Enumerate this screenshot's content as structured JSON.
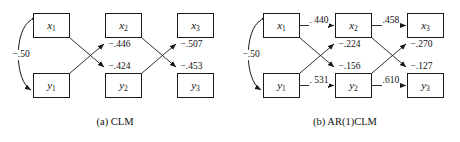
{
  "figure": {
    "width": 460,
    "height": 142,
    "background": "#ffffff",
    "stroke_color": "#1a1a1a"
  },
  "panels": [
    {
      "id": "clm",
      "caption": "(a) CLM",
      "nodes": [
        {
          "name": "x1",
          "var": "x",
          "sub": "1",
          "x": 33,
          "y": 13,
          "w": 37,
          "h": 25
        },
        {
          "name": "x2",
          "var": "x",
          "sub": "2",
          "x": 105,
          "y": 13,
          "w": 37,
          "h": 25
        },
        {
          "name": "x3",
          "var": "x",
          "sub": "3",
          "x": 177,
          "y": 13,
          "w": 37,
          "h": 25
        },
        {
          "name": "y1",
          "var": "y",
          "sub": "1",
          "x": 33,
          "y": 73,
          "w": 37,
          "h": 25
        },
        {
          "name": "y2",
          "var": "y",
          "sub": "2",
          "x": 105,
          "y": 73,
          "w": 37,
          "h": 25
        },
        {
          "name": "y3",
          "var": "y",
          "sub": "3",
          "x": 177,
          "y": 73,
          "w": 37,
          "h": 25
        }
      ],
      "covariance": {
        "label": "−.50",
        "from": "x1",
        "to": "y1",
        "label_x": 12,
        "label_y": 50
      },
      "paths": [
        {
          "name": "x1-to-y2",
          "label": "−.424",
          "from": "x1",
          "to": "y2",
          "label_x": 108,
          "label_y": 62
        },
        {
          "name": "y1-to-x2",
          "label": "−.446",
          "from": "y1",
          "to": "x2",
          "label_x": 108,
          "label_y": 40
        },
        {
          "name": "x2-to-y3",
          "label": "−.453",
          "from": "x2",
          "to": "y3",
          "label_x": 180,
          "label_y": 62
        },
        {
          "name": "y2-to-x3",
          "label": "−.507",
          "from": "y2",
          "to": "x3",
          "label_x": 180,
          "label_y": 40
        }
      ]
    },
    {
      "id": "ar1clm",
      "caption": "(b) AR(1)CLM",
      "nodes": [
        {
          "name": "x1",
          "var": "x",
          "sub": "1",
          "x": 33,
          "y": 13,
          "w": 37,
          "h": 25
        },
        {
          "name": "x2",
          "var": "x",
          "sub": "2",
          "x": 105,
          "y": 13,
          "w": 37,
          "h": 25
        },
        {
          "name": "x3",
          "var": "x",
          "sub": "3",
          "x": 177,
          "y": 13,
          "w": 37,
          "h": 25
        },
        {
          "name": "y1",
          "var": "y",
          "sub": "1",
          "x": 33,
          "y": 73,
          "w": 37,
          "h": 25
        },
        {
          "name": "y2",
          "var": "y",
          "sub": "2",
          "x": 105,
          "y": 73,
          "w": 37,
          "h": 25
        },
        {
          "name": "y3",
          "var": "y",
          "sub": "3",
          "x": 177,
          "y": 73,
          "w": 37,
          "h": 25
        }
      ],
      "covariance": {
        "label": "−.50",
        "from": "x1",
        "to": "y1",
        "label_x": 12,
        "label_y": 50
      },
      "paths": [
        {
          "name": "x1-to-x2",
          "label": ". 440",
          "from": "x1",
          "to": "x2",
          "label_x": 79,
          "label_y": 16
        },
        {
          "name": "x2-to-x3",
          "label": ".458",
          "from": "x2",
          "to": "x3",
          "label_x": 152,
          "label_y": 16
        },
        {
          "name": "y1-to-y2",
          "label": ". 531",
          "from": "y1",
          "to": "y2",
          "label_x": 79,
          "label_y": 76
        },
        {
          "name": "y2-to-y3",
          "label": ".610",
          "from": "y2",
          "to": "y3",
          "label_x": 152,
          "label_y": 76
        },
        {
          "name": "y1-to-x2",
          "label": "−.224",
          "from": "y1",
          "to": "x2",
          "label_x": 108,
          "label_y": 40
        },
        {
          "name": "x1-to-y2",
          "label": "−.156",
          "from": "x1",
          "to": "y2",
          "label_x": 108,
          "label_y": 62
        },
        {
          "name": "y2-to-x3",
          "label": "−.270",
          "from": "y2",
          "to": "x3",
          "label_x": 180,
          "label_y": 40
        },
        {
          "name": "x2-to-y3",
          "label": "−.127",
          "from": "x2",
          "to": "y3",
          "label_x": 180,
          "label_y": 62
        }
      ]
    }
  ]
}
